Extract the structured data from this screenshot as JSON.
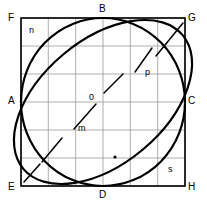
{
  "figure": {
    "background_color": "#ffffff",
    "stroke_color": "#000000",
    "grid_color": "#9a9a9a",
    "width": 207,
    "height": 204
  },
  "square": {
    "name": "FGHE",
    "left": 21,
    "top": 18,
    "right": 185,
    "bottom": 186,
    "stroke_width": 1.6
  },
  "grid": {
    "columns": 6,
    "rows": 6,
    "line_width": 0.8,
    "x_lines": [
      21,
      48.3,
      75.7,
      103,
      130.3,
      157.7,
      185
    ],
    "y_lines": [
      18,
      46,
      74,
      102,
      130,
      158,
      186
    ]
  },
  "circle": {
    "center_x": 103,
    "center_y": 102,
    "radius_x": 82,
    "radius_y": 84,
    "stroke_width": 2.2
  },
  "ellipse": {
    "center_x": 103,
    "center_y": 102,
    "semi_major": 104,
    "semi_minor": 62,
    "rotation_deg": -40,
    "stroke_width": 2.2
  },
  "corner_labels": [
    {
      "id": "F",
      "text": "F",
      "x": 8,
      "y": 13
    },
    {
      "id": "B",
      "text": "B",
      "x": 99,
      "y": 4
    },
    {
      "id": "G",
      "text": "G",
      "x": 188,
      "y": 13
    },
    {
      "id": "A",
      "text": "A",
      "x": 8,
      "y": 96
    },
    {
      "id": "C",
      "text": "C",
      "x": 188,
      "y": 96
    },
    {
      "id": "E",
      "text": "E",
      "x": 8,
      "y": 182
    },
    {
      "id": "D",
      "text": "D",
      "x": 99,
      "y": 190
    },
    {
      "id": "H",
      "text": "H",
      "x": 188,
      "y": 182
    }
  ],
  "point_labels": [
    {
      "id": "n",
      "text": "n",
      "x": 29,
      "y": 26
    },
    {
      "id": "o",
      "text": "0",
      "x": 89,
      "y": 93
    },
    {
      "id": "p",
      "text": "p",
      "x": 145,
      "y": 68
    },
    {
      "id": "m",
      "text": "m",
      "x": 78,
      "y": 124
    },
    {
      "id": "s",
      "text": "s",
      "x": 168,
      "y": 165
    }
  ],
  "tick_segments": [
    {
      "id": "tick-g-corner",
      "x1": 156,
      "y1": 56,
      "x2": 183,
      "y2": 23
    },
    {
      "id": "tick-upper-p",
      "x1": 135,
      "y1": 72,
      "x2": 152,
      "y2": 48
    },
    {
      "id": "tick-center-o",
      "x1": 104,
      "y1": 93,
      "x2": 123,
      "y2": 74
    },
    {
      "id": "tick-center-m",
      "x1": 74,
      "y1": 129,
      "x2": 96,
      "y2": 104
    },
    {
      "id": "tick-lower-left",
      "x1": 42,
      "y1": 162,
      "x2": 62,
      "y2": 138
    },
    {
      "id": "tick-e-corner",
      "x1": 24,
      "y1": 182,
      "x2": 40,
      "y2": 164
    }
  ],
  "dot_markers": [
    {
      "id": "dot-lower-center",
      "x": 115,
      "y": 157,
      "r": 1.6
    }
  ]
}
